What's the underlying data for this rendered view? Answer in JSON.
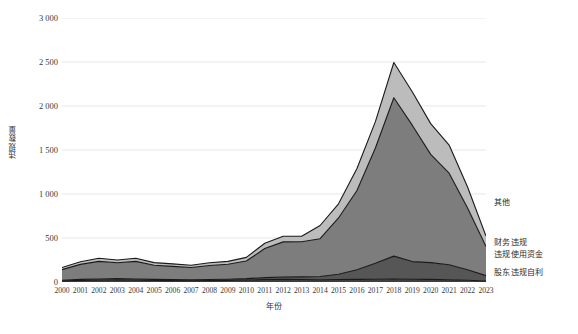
{
  "chart_data": {
    "type": "area",
    "stacked": true,
    "title": "",
    "xlabel": "年份",
    "ylabel": "违规数量",
    "grid": true,
    "legend_position": "right",
    "ylim": [
      0,
      3000
    ],
    "yticks": [
      0,
      500,
      1000,
      1500,
      2000,
      2500,
      3000
    ],
    "ytick_labels": [
      "0",
      "500",
      "1 000",
      "1 500",
      "2 000",
      "2 500",
      "3 000"
    ],
    "categories": [
      "2000",
      "2001",
      "2002",
      "2003",
      "2004",
      "2005",
      "2006",
      "2007",
      "2008",
      "2009",
      "2010",
      "2011",
      "2012",
      "2013",
      "2014",
      "2015",
      "2016",
      "2017",
      "2018",
      "2019",
      "2020",
      "2021",
      "2022",
      "2023"
    ],
    "series": [
      {
        "name": "股东违规自利",
        "color": "#3f3f3f",
        "values": [
          12,
          18,
          20,
          22,
          20,
          18,
          16,
          14,
          16,
          18,
          22,
          28,
          30,
          28,
          26,
          28,
          30,
          32,
          34,
          32,
          30,
          26,
          20,
          12
        ]
      },
      {
        "name": "违规使用资金",
        "color": "#565656",
        "values": [
          8,
          12,
          14,
          16,
          14,
          12,
          12,
          10,
          12,
          14,
          16,
          22,
          26,
          30,
          36,
          60,
          110,
          180,
          260,
          200,
          190,
          170,
          120,
          60
        ]
      },
      {
        "name": "财务违规",
        "color": "#7d7d7d",
        "values": [
          120,
          170,
          200,
          180,
          200,
          160,
          150,
          140,
          160,
          170,
          200,
          330,
          400,
          400,
          430,
          640,
          900,
          1310,
          1800,
          1550,
          1230,
          1040,
          700,
          330
        ]
      },
      {
        "name": "其他",
        "color": "#bcbcbc",
        "values": [
          25,
          30,
          36,
          32,
          36,
          30,
          28,
          26,
          30,
          32,
          42,
          60,
          64,
          62,
          150,
          160,
          250,
          300,
          400,
          380,
          350,
          320,
          240,
          120
        ]
      }
    ],
    "totals": [
      165,
      230,
      270,
      250,
      270,
      220,
      206,
      190,
      218,
      234,
      280,
      440,
      520,
      520,
      642,
      888,
      1290,
      1822,
      2494,
      2162,
      1800,
      1556,
      1080,
      522
    ],
    "annotations": []
  },
  "legend": {
    "items": [
      {
        "label": "其他",
        "color": "#bcbcbc",
        "top": 198
      },
      {
        "label": "财务违规",
        "color": "#7d7d7d",
        "top": 238
      },
      {
        "label": "违规使用资金",
        "color": "#565656",
        "top": 250
      },
      {
        "label": "股东违规自利",
        "color": "#3f3f3f",
        "top": 268
      }
    ]
  },
  "style": {
    "grid_color": "#dcdcdc",
    "axis_text_color": "#3a3a3a",
    "outline_color": "#1a1a1a",
    "background": "#ffffff"
  }
}
